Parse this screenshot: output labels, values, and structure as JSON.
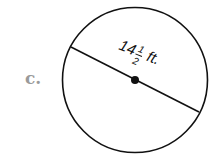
{
  "problem": {
    "letter": "c."
  },
  "figure": {
    "shape": "circle",
    "measure": "diameter",
    "whole": "14",
    "numerator": "1",
    "denominator": "2",
    "unit": "ft.",
    "stroke_color": "#111111",
    "label_color": "#9a9a9a"
  }
}
